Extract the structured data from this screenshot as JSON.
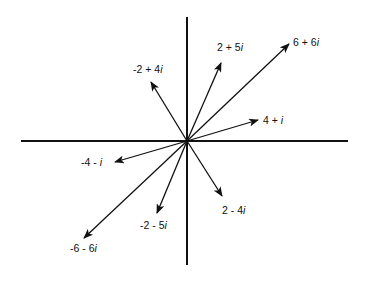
{
  "diagram": {
    "title": "",
    "kind": "complex-plane-vectors",
    "colors": {
      "background": "#ffffff",
      "ink": "#111111"
    },
    "origin": {
      "x": 187,
      "y": 141
    },
    "axes": {
      "horizontal": {
        "x1": 21,
        "x2": 348,
        "y": 141
      },
      "vertical": {
        "x": 187,
        "y1": 17,
        "y2": 265
      }
    },
    "vectors": [
      {
        "id": "v-6p6i",
        "label": "6 + 6i",
        "re": 6,
        "im": 6,
        "tip": [
          289,
          44
        ],
        "label_pos": [
          293,
          46
        ],
        "anchor": "start"
      },
      {
        "id": "v-2p5i",
        "label": "2 + 5i",
        "re": 2,
        "im": 5,
        "tip": [
          221,
          63
        ],
        "label_pos": [
          217,
          51
        ],
        "anchor": "start"
      },
      {
        "id": "v-m2p4i",
        "label": "-2 + 4i",
        "re": -2,
        "im": 4,
        "tip": [
          151,
          82
        ],
        "label_pos": [
          133,
          73
        ],
        "anchor": "start"
      },
      {
        "id": "v-4p1i",
        "label": "4 + i",
        "re": 4,
        "im": 1,
        "tip": [
          258,
          120
        ],
        "label_pos": [
          263,
          124
        ],
        "anchor": "start"
      },
      {
        "id": "v-m4m1i",
        "label": "-4 - i",
        "re": -4,
        "im": -1,
        "tip": [
          115,
          162
        ],
        "label_pos": [
          81,
          166
        ],
        "anchor": "start"
      },
      {
        "id": "v-2m4i",
        "label": "2 - 4i",
        "re": 2,
        "im": -4,
        "tip": [
          222,
          196
        ],
        "label_pos": [
          222,
          214
        ],
        "anchor": "start"
      },
      {
        "id": "v-m2m5i",
        "label": "-2 - 5i",
        "re": -2,
        "im": -5,
        "tip": [
          157,
          213
        ],
        "label_pos": [
          140,
          229
        ],
        "anchor": "start"
      },
      {
        "id": "v-m6m6i",
        "label": "-6 - 6i",
        "re": -6,
        "im": -6,
        "tip": [
          84,
          238
        ],
        "label_pos": [
          70,
          252
        ],
        "anchor": "start"
      }
    ]
  }
}
